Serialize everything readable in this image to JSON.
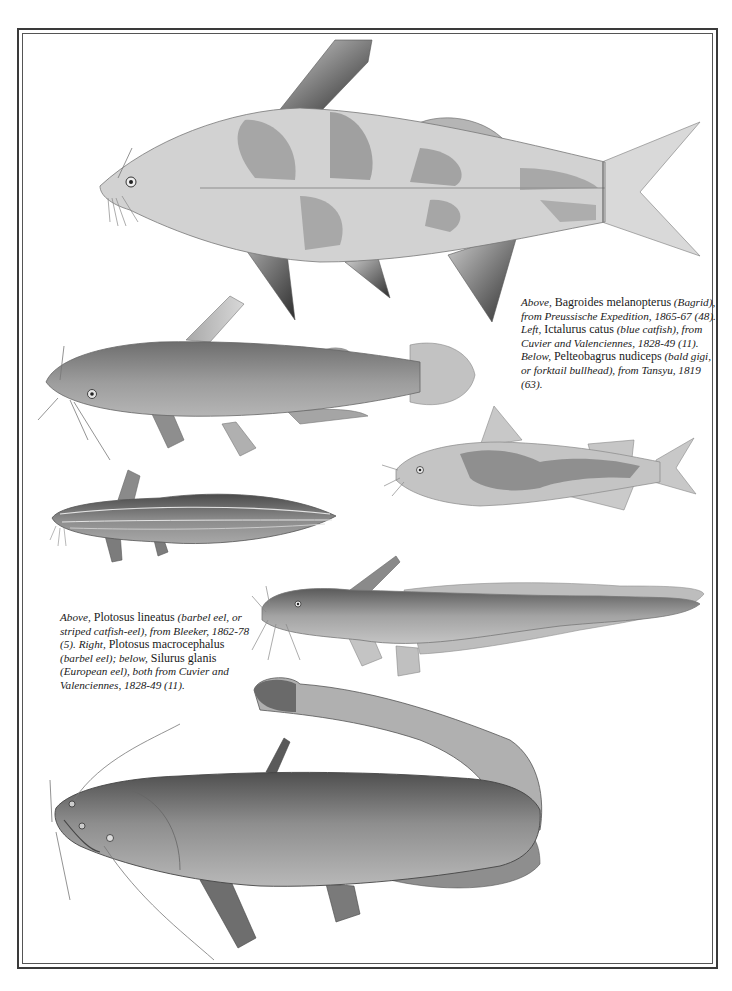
{
  "page": {
    "background": "#ffffff",
    "frame_color": "#3a3a3a",
    "ink_color": "#1a1a1a"
  },
  "captions": {
    "top": {
      "s1_it": "Above,",
      "s2_rm": " Bagroides melanopterus",
      "s3_it": " (Bagrid), from Preussische Expedition, 1865-67 (48). Left,",
      "s4_rm": " Ictalurus catus",
      "s5_it": " (blue catfish), from Cuvier and Valenciennes, 1828-49 (11). Below,",
      "s6_rm": " Pelteobagrus nudiceps",
      "s7_it": " (bald gigi, or forktail bullhead), from Tansyu, 1819 (63)."
    },
    "bottom": {
      "s1_it": "Above,",
      "s2_rm": " Plotosus lineatus",
      "s3_it": " (barbel eel, or striped catfish-eel), from Bleeker, 1862-78 (5). Right,",
      "s4_rm": " Plotosus macrocephalus",
      "s5_it": " (barbel eel); below,",
      "s6_rm": " Silurus glanis",
      "s7_it": " (European eel), both from Cuvier and Valenciennes, 1828-49 (11)."
    }
  },
  "illustrations": [
    {
      "species": "Bagroides melanopterus",
      "common": "Bagrid",
      "position": "top-right"
    },
    {
      "species": "Ictalurus catus",
      "common": "blue catfish",
      "position": "middle-left"
    },
    {
      "species": "Pelteobagrus nudiceps",
      "common": "bald gigi, or forktail bullhead",
      "position": "middle-right"
    },
    {
      "species": "Plotosus lineatus",
      "common": "barbel eel, or striped catfish-eel",
      "position": "lower-left"
    },
    {
      "species": "Plotosus macrocephalus",
      "common": "barbel eel",
      "position": "lower-right"
    },
    {
      "species": "Silurus glanis",
      "common": "European eel",
      "position": "bottom"
    }
  ]
}
